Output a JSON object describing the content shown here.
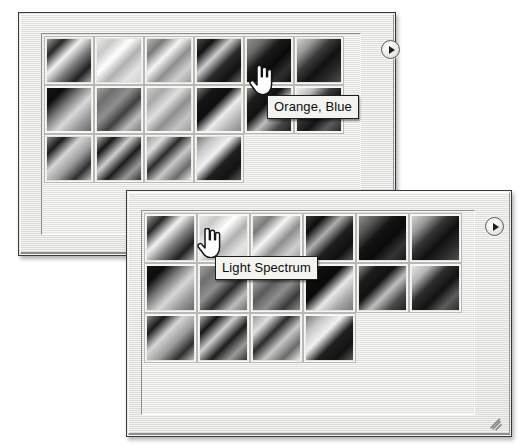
{
  "image": {
    "kind": "screenshot-illustration",
    "color_mode": "grayscale",
    "background": "#ffffff"
  },
  "colors": {
    "panel_face": "#ebebe7",
    "panel_border": "#3a3a3a",
    "well_background": "#ebebe7",
    "swatch_border": "#b9b9b4",
    "tooltip_background": "#f3f3ef",
    "tooltip_border": "#1e1e1e",
    "tooltip_text": "#0d0d0d",
    "scrollbar_track": "#f0f0ec",
    "scrollbar_thumb": "#ffffff"
  },
  "panels": [
    {
      "id": "gradient-picker-top",
      "name": "Gradient Picker Panel (back)",
      "geometry": {
        "left": 18,
        "top": 12,
        "width": 378,
        "height": 244
      },
      "well": {
        "left": 22,
        "top": 20,
        "width": 320,
        "height": 202
      },
      "swatch": {
        "width": 50,
        "height": 49,
        "columns": 6
      },
      "flyout_button": {
        "icon": "right-triangle-in-circle-icon",
        "label": "Gradient picker menu",
        "left": 362,
        "top": 27
      },
      "scrollbar": {
        "left": 325,
        "top": 22,
        "width": 14,
        "height": 198,
        "thumb_height": 196,
        "orientation": "vertical"
      },
      "tooltip": {
        "text": "Orange, Blue",
        "left": 248,
        "top": 82
      },
      "cursor": {
        "type": "pointing-hand-cursor",
        "left": 229,
        "top": 52
      },
      "swatches": [
        {
          "index": 0,
          "name": "gradient-swatch",
          "angle": 135,
          "stops": [
            "#9c9c9c",
            "#262626",
            "#f2f2f2",
            "#7d7d7d",
            "#1f1f1f",
            "#a8a8a8"
          ]
        },
        {
          "index": 1,
          "name": "gradient-swatch",
          "angle": 135,
          "stops": [
            "#e8e8e8",
            "#c9c9c9",
            "#ffffff",
            "#b0b0b0",
            "#e4e4e4",
            "#d2d2d2"
          ]
        },
        {
          "index": 2,
          "name": "gradient-swatch",
          "angle": 135,
          "stops": [
            "#b5b5b5",
            "#7a7a7a",
            "#f6f6f6",
            "#8e8e8e",
            "#cfcfcf",
            "#9d9d9d"
          ]
        },
        {
          "index": 3,
          "name": "gradient-swatch",
          "angle": 135,
          "stops": [
            "#4a4a4a",
            "#101010",
            "#cfcfcf",
            "#2a2a2a",
            "#111111",
            "#6a6a6a"
          ]
        },
        {
          "index": 4,
          "name": "gradient-swatch",
          "angle": 135,
          "stops": [
            "#8e8e8e",
            "#6d6d6d",
            "#1a1a1a",
            "#0a0a0a",
            "#2e2e2e",
            "#101010"
          ],
          "hovered": true,
          "tooltip": "Orange, Blue"
        },
        {
          "index": 5,
          "name": "gradient-swatch",
          "angle": 135,
          "stops": [
            "#cfcfcf",
            "#9a9a9a",
            "#3a3a3a",
            "#111111",
            "#2b2b2b",
            "#4e4e4e"
          ]
        },
        {
          "index": 6,
          "name": "gradient-swatch",
          "angle": 135,
          "stops": [
            "#141414",
            "#0d0d0d",
            "#7a7a7a",
            "#d8d8d8",
            "#9a9a9a",
            "#6a6a6a"
          ]
        },
        {
          "index": 7,
          "name": "gradient-swatch",
          "angle": 135,
          "stops": [
            "#a2a2a2",
            "#6f6f6f",
            "#8f8f8f",
            "#3f3f3f",
            "#bdbdbd",
            "#7e7e7e"
          ]
        },
        {
          "index": 8,
          "name": "gradient-swatch",
          "angle": 135,
          "stops": [
            "#cacaca",
            "#a8a8a8",
            "#e0e0e0",
            "#8f8f8f",
            "#c4c4c4",
            "#9e9e9e"
          ]
        },
        {
          "index": 9,
          "name": "gradient-swatch",
          "angle": 135,
          "stops": [
            "#7d7d7d",
            "#151515",
            "#0e0e0e",
            "#ededed",
            "#b5b5b5",
            "#8a8a8a"
          ]
        },
        {
          "index": 10,
          "name": "gradient-swatch",
          "angle": 135,
          "stops": [
            "#8f8f8f",
            "#1c1c1c",
            "#111111",
            "#c0c0c0",
            "#4a4a4a",
            "#222222"
          ]
        },
        {
          "index": 11,
          "name": "gradient-swatch",
          "angle": 135,
          "stops": [
            "#efefef",
            "#bdbdbd",
            "#3a3a3a",
            "#141414",
            "#5c5c5c",
            "#2b2b2b"
          ]
        },
        {
          "index": 12,
          "name": "gradient-swatch",
          "angle": 135,
          "stops": [
            "#8a8a8a",
            "#1a1a1a",
            "#d6d6d6",
            "#9c9c9c",
            "#2e2e2e",
            "#bdbdbd"
          ]
        },
        {
          "index": 13,
          "name": "gradient-swatch",
          "angle": 135,
          "stops": [
            "#b0b0b0",
            "#151515",
            "#cfcfcf",
            "#1d1d1d",
            "#9a9a9a",
            "#343434"
          ]
        },
        {
          "index": 14,
          "name": "gradient-swatch",
          "angle": 135,
          "stops": [
            "#9e9e9e",
            "#dedede",
            "#2a2a2a",
            "#c8c8c8",
            "#6a6a6a",
            "#ededed"
          ]
        },
        {
          "index": 15,
          "name": "gradient-swatch",
          "angle": 135,
          "stops": [
            "#7a7a7a",
            "#c6c6c6",
            "#f2f2f2",
            "#1f1f1f",
            "#121212",
            "#5a5a5a"
          ]
        }
      ]
    },
    {
      "id": "gradient-picker-bottom",
      "name": "Gradient Picker Panel (front)",
      "geometry": {
        "left": 126,
        "top": 190,
        "width": 386,
        "height": 247
      },
      "well": {
        "left": 14,
        "top": 19,
        "width": 334,
        "height": 205
      },
      "swatch": {
        "width": 53,
        "height": 50,
        "columns": 6
      },
      "flyout_button": {
        "icon": "right-triangle-in-circle-icon",
        "label": "Gradient picker menu",
        "left": 358,
        "top": 26
      },
      "scrollbar": {
        "left": 315,
        "top": 21,
        "width": 15,
        "height": 201,
        "thumb_height": 199,
        "orientation": "vertical"
      },
      "tooltip": {
        "text": "Light Spectrum",
        "left": 88,
        "top": 65
      },
      "cursor": {
        "type": "pointing-hand-cursor",
        "left": 69,
        "top": 37
      },
      "resize_grip": {
        "icon": "resize-grip-icon",
        "left": 362,
        "top": 222
      },
      "swatches": [
        {
          "index": 0,
          "name": "gradient-swatch",
          "angle": 135,
          "stops": [
            "#9c9c9c",
            "#262626",
            "#f2f2f2",
            "#7d7d7d",
            "#1f1f1f",
            "#a8a8a8"
          ]
        },
        {
          "index": 1,
          "name": "gradient-swatch",
          "angle": 135,
          "stops": [
            "#e8e8e8",
            "#c9c9c9",
            "#ffffff",
            "#b0b0b0",
            "#e4e4e4",
            "#d2d2d2"
          ],
          "hovered": true,
          "tooltip": "Light Spectrum"
        },
        {
          "index": 2,
          "name": "gradient-swatch",
          "angle": 135,
          "stops": [
            "#b5b5b5",
            "#7a7a7a",
            "#f6f6f6",
            "#8e8e8e",
            "#cfcfcf",
            "#9d9d9d"
          ]
        },
        {
          "index": 3,
          "name": "gradient-swatch",
          "angle": 135,
          "stops": [
            "#3a3a3a",
            "#0d0d0d",
            "#b0b0b0",
            "#1e1e1e",
            "#0f0f0f",
            "#5a5a5a"
          ]
        },
        {
          "index": 4,
          "name": "gradient-swatch",
          "angle": 135,
          "stops": [
            "#8e8e8e",
            "#5a5a5a",
            "#151515",
            "#0a0a0a",
            "#343434",
            "#1a1a1a"
          ]
        },
        {
          "index": 5,
          "name": "gradient-swatch",
          "angle": 135,
          "stops": [
            "#d2d2d2",
            "#9a9a9a",
            "#343434",
            "#101010",
            "#2b2b2b",
            "#4e4e4e"
          ]
        },
        {
          "index": 6,
          "name": "gradient-swatch",
          "angle": 135,
          "stops": [
            "#141414",
            "#0d0d0d",
            "#7a7a7a",
            "#d8d8d8",
            "#9a9a9a",
            "#6a6a6a"
          ]
        },
        {
          "index": 7,
          "name": "gradient-swatch",
          "angle": 135,
          "stops": [
            "#a2a2a2",
            "#6f6f6f",
            "#8f8f8f",
            "#2a2a2a",
            "#bdbdbd",
            "#6e6e6e"
          ]
        },
        {
          "index": 8,
          "name": "gradient-swatch",
          "angle": 135,
          "stops": [
            "#bcbcbc",
            "#9a9a9a",
            "#5a5a5a",
            "#8f8f8f",
            "#3a3a3a",
            "#8e8e8e"
          ]
        },
        {
          "index": 9,
          "name": "gradient-swatch",
          "angle": 135,
          "stops": [
            "#6a6a6a",
            "#0f0f0f",
            "#090909",
            "#e8e8e8",
            "#a5a5a5",
            "#7a7a7a"
          ]
        },
        {
          "index": 10,
          "name": "gradient-swatch",
          "angle": 135,
          "stops": [
            "#8f8f8f",
            "#1c1c1c",
            "#111111",
            "#c0c0c0",
            "#4a4a4a",
            "#222222"
          ]
        },
        {
          "index": 11,
          "name": "gradient-swatch",
          "angle": 135,
          "stops": [
            "#e4e4e4",
            "#b5b5b5",
            "#2e2e2e",
            "#121212",
            "#5c5c5c",
            "#2b2b2b"
          ]
        },
        {
          "index": 12,
          "name": "gradient-swatch",
          "angle": 135,
          "stops": [
            "#8a8a8a",
            "#1a1a1a",
            "#d6d6d6",
            "#9c9c9c",
            "#2e2e2e",
            "#bdbdbd"
          ]
        },
        {
          "index": 13,
          "name": "gradient-swatch",
          "angle": 135,
          "stops": [
            "#b0b0b0",
            "#151515",
            "#cfcfcf",
            "#1d1d1d",
            "#9a9a9a",
            "#343434"
          ]
        },
        {
          "index": 14,
          "name": "gradient-swatch",
          "angle": 135,
          "stops": [
            "#9e9e9e",
            "#dedede",
            "#2a2a2a",
            "#c8c8c8",
            "#6a6a6a",
            "#ededed"
          ]
        },
        {
          "index": 15,
          "name": "gradient-swatch",
          "angle": 135,
          "stops": [
            "#7a7a7a",
            "#c6c6c6",
            "#f2f2f2",
            "#1f1f1f",
            "#121212",
            "#5a5a5a"
          ]
        }
      ]
    }
  ]
}
